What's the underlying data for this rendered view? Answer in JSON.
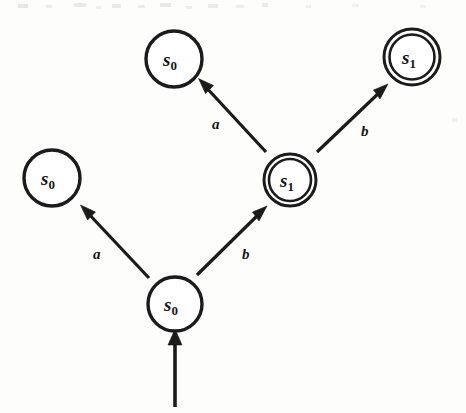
{
  "figure": {
    "width": 466,
    "height": 413,
    "background_color": "#fdfdfc",
    "ink_color": "#1b1b1b"
  },
  "nodes": [
    {
      "id": "node-top-left",
      "name": "state-s0-top-left",
      "state": "s",
      "subscript": "0",
      "label": "s0",
      "cx": 174,
      "cy": 59,
      "r": 28,
      "accepting": false,
      "stroke_width": 3.4
    },
    {
      "id": "node-top-right",
      "name": "state-s1-top-right",
      "state": "s",
      "subscript": "1",
      "label": "s1",
      "cx": 412,
      "cy": 57,
      "r": 28,
      "r_inner": 22.5,
      "accepting": true,
      "stroke_width": 3.0
    },
    {
      "id": "node-left",
      "name": "state-s0-left",
      "state": "s",
      "subscript": "0",
      "label": "s0",
      "cx": 52,
      "cy": 178,
      "r": 28,
      "accepting": false,
      "stroke_width": 3.4
    },
    {
      "id": "node-center",
      "name": "state-s1-center",
      "state": "s",
      "subscript": "1",
      "label": "s1",
      "cx": 290,
      "cy": 180,
      "r": 26,
      "r_inner": 21,
      "accepting": true,
      "stroke_width": 3.0
    },
    {
      "id": "node-bottom",
      "name": "state-s0-start",
      "state": "s",
      "subscript": "0",
      "label": "s0",
      "cx": 175,
      "cy": 304,
      "r": 27,
      "accepting": false,
      "stroke_width": 3.4
    }
  ],
  "edges": [
    {
      "id": "edge-center-to-topleft",
      "name": "transition-a-upper-left",
      "symbol": "a",
      "from": "node-center",
      "to": "node-top-left",
      "x1": 266,
      "y1": 152,
      "x2": 199,
      "y2": 80,
      "label_x": 215,
      "label_y": 128,
      "stroke_width": 3.2
    },
    {
      "id": "edge-center-to-topright",
      "name": "transition-b-upper-right",
      "symbol": "b",
      "from": "node-center",
      "to": "node-top-right",
      "x1": 317,
      "y1": 152,
      "x2": 387,
      "y2": 85,
      "label_x": 364,
      "label_y": 135,
      "stroke_width": 3.2
    },
    {
      "id": "edge-bottom-to-left",
      "name": "transition-a-lower-left",
      "symbol": "a",
      "from": "node-bottom",
      "to": "node-left",
      "x1": 149,
      "y1": 278,
      "x2": 81,
      "y2": 206,
      "label_x": 96,
      "label_y": 258,
      "stroke_width": 3.2
    },
    {
      "id": "edge-bottom-to-center",
      "name": "transition-b-lower-right",
      "symbol": "b",
      "from": "node-bottom",
      "to": "node-center",
      "x1": 197,
      "y1": 275,
      "x2": 266,
      "y2": 207,
      "label_x": 245,
      "label_y": 258,
      "stroke_width": 3.2
    }
  ],
  "start_arrow": {
    "id": "edge-start",
    "name": "start-state-arrow",
    "x1": 175,
    "y1": 407,
    "x2": 175,
    "y2": 330,
    "stroke_width": 3.6,
    "label": ""
  },
  "alphabet": [
    "a",
    "b"
  ],
  "states": [
    "s0",
    "s1"
  ],
  "accepting_states": [
    "s1"
  ],
  "start_state": "s0"
}
